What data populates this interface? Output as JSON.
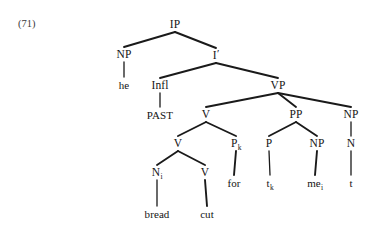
{
  "figure": {
    "example_number": "(71)",
    "kind": "syntactic-tree-diagram",
    "sentence": "he PAST bread cut for t_k me_i t",
    "line_color": "#1a1a1a"
  },
  "nodes": {
    "ip": {
      "label": "IP",
      "x": 175,
      "y": 25
    },
    "np_subject": {
      "label": "NP",
      "x": 124,
      "y": 55
    },
    "he": {
      "label": "he",
      "x": 124,
      "y": 85
    },
    "i_bar": {
      "label": "I",
      "prime": "′",
      "x": 216,
      "y": 56
    },
    "infl": {
      "label": "Infl",
      "x": 160,
      "y": 86
    },
    "past": {
      "label": "PAST",
      "x": 160,
      "y": 115
    },
    "vp": {
      "label": "VP",
      "x": 278,
      "y": 86
    },
    "v_upper": {
      "label": "V",
      "x": 206,
      "y": 115
    },
    "v_lower": {
      "label": "V",
      "x": 178,
      "y": 144
    },
    "n_i": {
      "label": "N",
      "sub": "i",
      "x": 157,
      "y": 173
    },
    "bread": {
      "label": "bread",
      "x": 157,
      "y": 214
    },
    "v_cut": {
      "label": "V",
      "x": 205,
      "y": 173
    },
    "cut": {
      "label": "cut",
      "x": 207,
      "y": 214
    },
    "p_k": {
      "label": "P",
      "sub": "k",
      "x": 236,
      "y": 144
    },
    "for": {
      "label": "for",
      "x": 234,
      "y": 183
    },
    "pp": {
      "label": "PP",
      "x": 296,
      "y": 115
    },
    "p_prep": {
      "label": "P",
      "x": 269,
      "y": 144
    },
    "t_k": {
      "label": "t",
      "sub": "k",
      "x": 270,
      "y": 183
    },
    "np_object": {
      "label": "NP",
      "x": 317,
      "y": 144
    },
    "me_i": {
      "label": "me",
      "sub": "i",
      "x": 315,
      "y": 183
    },
    "np_right": {
      "label": "NP",
      "x": 351,
      "y": 115
    },
    "n_right": {
      "label": "N",
      "x": 351,
      "y": 144
    },
    "t_right": {
      "label": "t",
      "x": 351,
      "y": 183
    }
  },
  "edges": [
    {
      "from": "ip",
      "to": "np_subject"
    },
    {
      "from": "ip",
      "to": "i_bar"
    },
    {
      "from": "np_subject",
      "to": "he"
    },
    {
      "from": "i_bar",
      "to": "infl"
    },
    {
      "from": "i_bar",
      "to": "vp"
    },
    {
      "from": "infl",
      "to": "past"
    },
    {
      "from": "vp",
      "to": "v_upper"
    },
    {
      "from": "vp",
      "to": "pp"
    },
    {
      "from": "vp",
      "to": "np_right"
    },
    {
      "from": "v_upper",
      "to": "v_lower"
    },
    {
      "from": "v_upper",
      "to": "p_k"
    },
    {
      "from": "v_lower",
      "to": "n_i"
    },
    {
      "from": "v_lower",
      "to": "v_cut"
    },
    {
      "from": "n_i",
      "to": "bread"
    },
    {
      "from": "v_cut",
      "to": "cut"
    },
    {
      "from": "p_k",
      "to": "for"
    },
    {
      "from": "pp",
      "to": "p_prep"
    },
    {
      "from": "pp",
      "to": "np_object"
    },
    {
      "from": "p_prep",
      "to": "t_k"
    },
    {
      "from": "np_object",
      "to": "me_i"
    },
    {
      "from": "np_right",
      "to": "n_right"
    },
    {
      "from": "n_right",
      "to": "t_right"
    }
  ]
}
